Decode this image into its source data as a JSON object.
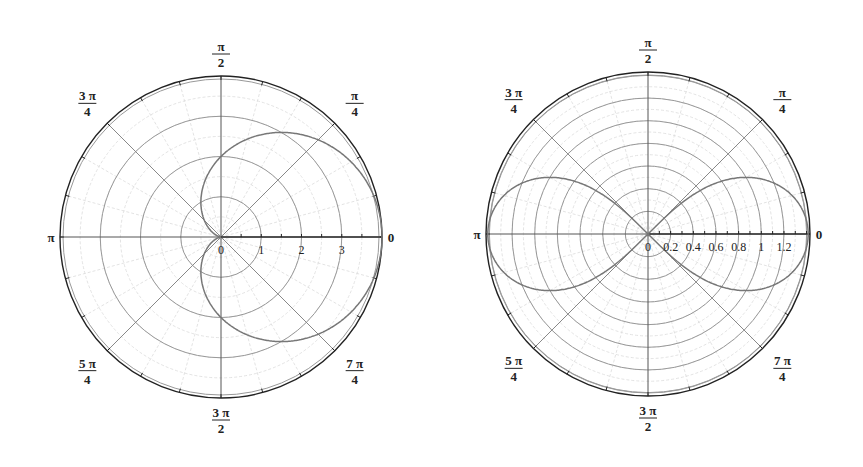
{
  "chart_data": [
    {
      "type": "polar-line",
      "title": "",
      "function": "r = 2 + 2cos(theta)",
      "center_px": [
        221,
        237
      ],
      "outer_radius_px": 161,
      "r_max": 4,
      "radial_rings": [
        1,
        2,
        3,
        4
      ],
      "radial_tick_labels": [
        "0",
        "1",
        "2",
        "3"
      ],
      "angle_labels": [
        {
          "angle": "0",
          "num": "0",
          "den": ""
        },
        {
          "angle": "pi/4",
          "num": "π",
          "den": "4"
        },
        {
          "angle": "pi/2",
          "num": "π",
          "den": "2"
        },
        {
          "angle": "3pi/4",
          "num": "3 π",
          "den": "4"
        },
        {
          "angle": "pi",
          "num": "π",
          "den": ""
        },
        {
          "angle": "5pi/4",
          "num": "5 π",
          "den": "4"
        },
        {
          "angle": "3pi/2",
          "num": "3 π",
          "den": "2"
        },
        {
          "angle": "7pi/4",
          "num": "7 π",
          "den": "4"
        }
      ],
      "curve_color": "#777777"
    },
    {
      "type": "polar-line",
      "title": "",
      "function": "r^2 = 2cos(2theta)",
      "center_px": [
        648,
        234
      ],
      "outer_radius_px": 162,
      "r_max": 1.43,
      "radial_rings": [
        0.2,
        0.4,
        0.6,
        0.8,
        1.0,
        1.2,
        1.4
      ],
      "radial_tick_labels": [
        "0",
        "0.2",
        "0.4",
        "0.6",
        "0.8",
        "1",
        "1.2"
      ],
      "angle_labels": [
        {
          "angle": "0",
          "num": "0",
          "den": ""
        },
        {
          "angle": "pi/4",
          "num": "π",
          "den": "4"
        },
        {
          "angle": "pi/2",
          "num": "π",
          "den": "2"
        },
        {
          "angle": "3pi/4",
          "num": "3 π",
          "den": "4"
        },
        {
          "angle": "pi",
          "num": "π",
          "den": ""
        },
        {
          "angle": "5pi/4",
          "num": "5 π",
          "den": "4"
        },
        {
          "angle": "3pi/2",
          "num": "3 π",
          "den": "2"
        },
        {
          "angle": "7pi/4",
          "num": "7 π",
          "den": "4"
        }
      ],
      "curve_color": "#777777"
    }
  ]
}
